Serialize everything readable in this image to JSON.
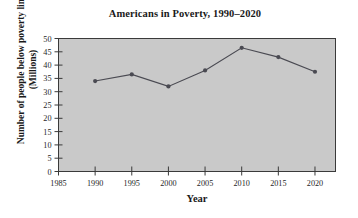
{
  "chart_data": {
    "type": "line",
    "title": "Americans in Poverty, 1990–2020",
    "xlabel": "Year",
    "ylabel": "Number of people below poverty line (Millions)",
    "ylabel_line1": "Number of people below poverty line",
    "ylabel_line2": "(Millions)",
    "x": [
      1990,
      1995,
      2000,
      2005,
      2010,
      2015,
      2020
    ],
    "values": [
      34,
      36.5,
      32,
      38,
      46.5,
      43,
      37.5
    ],
    "categories": [
      "1990",
      "1995",
      "2000",
      "2005",
      "2010",
      "2015",
      "2020"
    ],
    "series": [
      {
        "name": "Number of people below poverty line (Millions)",
        "values": [
          34,
          36.5,
          32,
          38,
          46.5,
          43,
          37.5
        ]
      }
    ],
    "xlim": [
      1985,
      2022.8
    ],
    "ylim": [
      0,
      50
    ],
    "xticks": [
      1985,
      1990,
      1995,
      2000,
      2005,
      2010,
      2015,
      2020
    ],
    "xtick_labels": [
      "1985",
      "1990",
      "1995",
      "2000",
      "2005",
      "2010",
      "2015",
      "2020"
    ],
    "yticks": [
      0,
      5,
      10,
      15,
      20,
      25,
      30,
      35,
      40,
      45,
      50
    ],
    "ytick_labels": [
      "0",
      "5",
      "10",
      "15",
      "20",
      "25",
      "30",
      "35",
      "40",
      "45",
      "50"
    ],
    "grid": false,
    "legend": false,
    "legend_position": "none",
    "plot_background_color": "#c9c9c9",
    "figure_background_color": "#ffffff",
    "line_color": "#4a4a52",
    "marker_color": "#4a4a52",
    "marker_shape": "circle",
    "axis_color": "#3a3a3a"
  }
}
